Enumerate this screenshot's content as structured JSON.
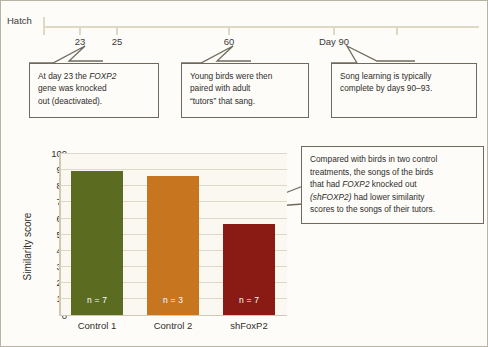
{
  "figure": {
    "background_color": "#fdfcf8",
    "border_color": "#b9b3a4"
  },
  "timeline": {
    "origin_label": "Hatch",
    "axis_color": "#ddd9c3",
    "ticks": [
      {
        "label": "23",
        "x": 78
      },
      {
        "label": "25",
        "x": 115
      },
      {
        "label": "60",
        "x": 227
      },
      {
        "label": "Day 90",
        "x": 332
      },
      {
        "label": "",
        "x": 395
      }
    ]
  },
  "callouts": [
    {
      "name": "callout-foxp2-knockout",
      "line1": "At day 23 the ",
      "italic1": "FOXP2",
      "line2": "gene was knocked",
      "line3": "out (deactivated).",
      "x": 28,
      "y": 62,
      "width": 130,
      "height": 55
    },
    {
      "name": "callout-tutors",
      "line1": "Young birds were then",
      "line2": "paired with adult",
      "line3": "“tutors” that sang.",
      "x": 180,
      "y": 62,
      "width": 128,
      "height": 55
    },
    {
      "name": "callout-song-learning",
      "line1": "Song learning is typically",
      "line2": "complete by days 90–93.",
      "x": 330,
      "y": 62,
      "width": 146,
      "height": 55
    },
    {
      "name": "callout-results",
      "line1": "Compared with birds in two control",
      "line2": "treatments, the songs of the birds",
      "line3a": "that had ",
      "line3_italic": "FOXP2",
      "line3b": " knocked out",
      "line4_italic": "(shFOXP2)",
      "line4b": " had lower similarity",
      "line5": "scores to the songs of their tutors.",
      "x": 300,
      "y": 145,
      "width": 183,
      "height": 78
    }
  ],
  "chart_data": {
    "type": "bar",
    "title": "",
    "xlabel": "",
    "ylabel": "Similarity score",
    "categories": [
      "Control 1",
      "Control 2",
      "shFoxP2"
    ],
    "values": [
      89,
      86,
      56
    ],
    "bar_labels": [
      "n = 7",
      "n = 3",
      "n = 7"
    ],
    "colors": [
      "#5b6b20",
      "#c8751f",
      "#8a1a14"
    ],
    "ylim": [
      0,
      100
    ],
    "yticks": [
      0,
      10,
      20,
      30,
      40,
      50,
      60,
      70,
      80,
      90,
      100
    ],
    "grid": true,
    "legend": "none",
    "plot_background": "#faf8f0",
    "gridline_color": "#ddd9c9"
  }
}
